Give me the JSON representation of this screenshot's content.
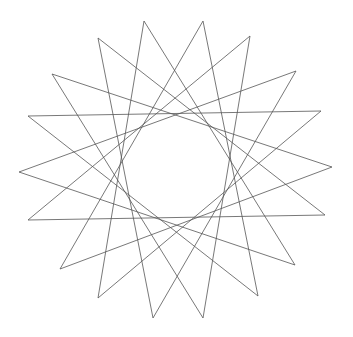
{
  "drawing": {
    "title": "",
    "background": "#ffffff",
    "stroke_color": "#555555",
    "center": [
      175,
      167
    ],
    "star_step": 7,
    "tips": [
      [
        332,
        167
      ],
      [
        325,
        215
      ],
      [
        295,
        265
      ],
      [
        258,
        296
      ],
      [
        203,
        318
      ],
      [
        153,
        318
      ],
      [
        98,
        298
      ],
      [
        60,
        269
      ],
      [
        28,
        220
      ],
      [
        19,
        172
      ],
      [
        28,
        116
      ],
      [
        52,
        74
      ],
      [
        98,
        38
      ],
      [
        144,
        21
      ],
      [
        203,
        21
      ],
      [
        250,
        36
      ],
      [
        296,
        71
      ],
      [
        321,
        111
      ]
    ]
  }
}
